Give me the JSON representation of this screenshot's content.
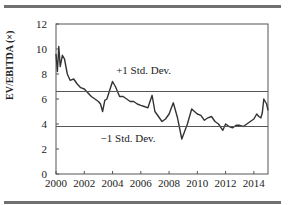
{
  "chart_data": {
    "type": "line",
    "title": "",
    "xlabel": "",
    "ylabel": "EV/EBITDA (×)",
    "xlim": [
      2000,
      2015
    ],
    "ylim": [
      0,
      12
    ],
    "x_ticks": [
      2000,
      2002,
      2004,
      2006,
      2008,
      2010,
      2012,
      2014
    ],
    "x_tick_labels": [
      "2000",
      "2002",
      "2004",
      "2006",
      "2008",
      "2010",
      "2012",
      "2014"
    ],
    "y_ticks": [
      0,
      2,
      4,
      6,
      8,
      10,
      12
    ],
    "y_tick_labels": [
      "0",
      "2",
      "4",
      "6",
      "8",
      "10",
      "12"
    ],
    "grid": false,
    "legend": null,
    "series": [
      {
        "name": "EV/EBITDA",
        "color": "#333333",
        "x": [
          2000.0,
          2000.1,
          2000.2,
          2000.3,
          2000.45,
          2000.6,
          2000.8,
          2001.0,
          2001.25,
          2001.5,
          2001.75,
          2002.0,
          2002.25,
          2002.5,
          2002.75,
          2003.0,
          2003.15,
          2003.3,
          2003.45,
          2003.6,
          2003.8,
          2004.0,
          2004.2,
          2004.5,
          2004.75,
          2005.0,
          2005.25,
          2005.5,
          2005.75,
          2006.0,
          2006.25,
          2006.5,
          2006.8,
          2007.0,
          2007.25,
          2007.5,
          2007.75,
          2008.0,
          2008.3,
          2008.6,
          2008.9,
          2009.1,
          2009.3,
          2009.6,
          2009.8,
          2010.0,
          2010.25,
          2010.5,
          2010.75,
          2011.0,
          2011.25,
          2011.5,
          2011.8,
          2012.0,
          2012.25,
          2012.5,
          2012.75,
          2013.0,
          2013.25,
          2013.5,
          2013.75,
          2014.0,
          2014.2,
          2014.35,
          2014.5,
          2014.6,
          2014.7,
          2014.8,
          2014.9,
          2015.0
        ],
        "values": [
          9.6,
          8.2,
          10.2,
          8.6,
          9.5,
          9.2,
          8.0,
          7.5,
          7.6,
          7.2,
          6.9,
          6.8,
          6.5,
          6.2,
          6.0,
          5.8,
          5.6,
          5.0,
          5.9,
          6.0,
          6.7,
          7.4,
          7.0,
          6.2,
          6.2,
          6.0,
          5.8,
          5.8,
          5.6,
          5.5,
          5.4,
          5.3,
          6.3,
          5.0,
          4.6,
          4.2,
          4.4,
          4.8,
          5.7,
          4.5,
          2.8,
          3.4,
          4.0,
          5.2,
          5.0,
          4.8,
          4.7,
          4.3,
          4.5,
          4.6,
          4.2,
          4.0,
          3.5,
          4.0,
          3.8,
          3.7,
          3.9,
          3.9,
          3.8,
          4.0,
          4.2,
          4.4,
          4.8,
          4.6,
          4.5,
          4.9,
          6.0,
          5.8,
          5.6,
          5.1
        ]
      },
      {
        "name": "+1 Std. Dev.",
        "color": "#555555",
        "x": [
          2000,
          2015
        ],
        "values": [
          6.6,
          6.6
        ]
      },
      {
        "name": "-1 Std. Dev.",
        "color": "#555555",
        "x": [
          2000,
          2015
        ],
        "values": [
          3.8,
          3.8
        ]
      }
    ],
    "annotations": [
      {
        "text": "+1 Std. Dev.",
        "x": 2006.2,
        "y": 8.0
      },
      {
        "text": "−1 Std. Dev.",
        "x": 2005.1,
        "y": 2.6
      }
    ]
  },
  "labels": {
    "ylabel": "EV/EBITDA (×)",
    "plus_std": "+1 Std. Dev.",
    "minus_std": "−1 Std. Dev."
  }
}
